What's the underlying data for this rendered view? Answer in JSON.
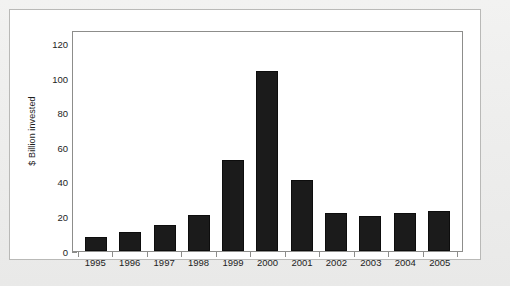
{
  "chart_data": {
    "type": "bar",
    "title": "",
    "subtitle": "",
    "xlabel": "",
    "ylabel": "$ Billion invested",
    "categories": [
      "1995",
      "1996",
      "1997",
      "1998",
      "1999",
      "2000",
      "2001",
      "2002",
      "2003",
      "2004",
      "2005"
    ],
    "values": [
      8,
      11,
      15,
      21,
      53,
      104,
      41,
      22,
      20,
      22,
      23
    ],
    "series": [
      {
        "name": "$ Billion invested",
        "values": [
          8,
          11,
          15,
          21,
          53,
          104,
          41,
          22,
          20,
          22,
          23
        ]
      }
    ],
    "ylim": [
      0,
      128
    ],
    "yticks": [
      0,
      20,
      40,
      60,
      80,
      100,
      120
    ],
    "ytick_labels": [
      "0",
      "20",
      "40",
      "60",
      "80",
      "100",
      "120"
    ],
    "grid": false,
    "legend": false,
    "legend_position": "none",
    "bar_color": "#1b1b1b",
    "axis_color": "#8d8d8b",
    "plot_background": "#ffffff",
    "page_background": "#ececeb",
    "annotations": []
  },
  "caption_ghost": ""
}
